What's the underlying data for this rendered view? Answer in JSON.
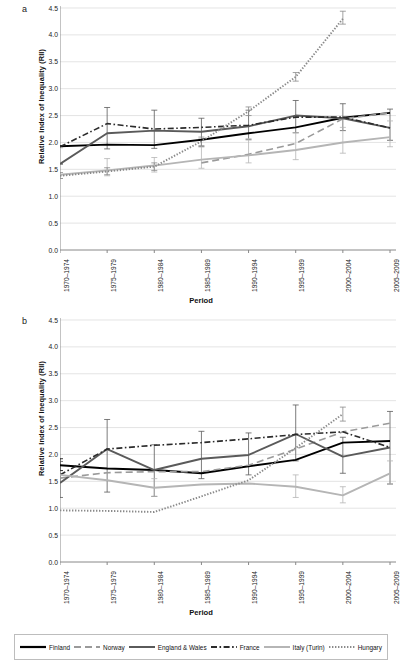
{
  "figure": {
    "panels": [
      {
        "letter": "a"
      },
      {
        "letter": "b"
      }
    ],
    "axis": {
      "xlabel": "Period",
      "ylabel": "Relative Index of Inequality (RII)",
      "yticks": [
        "4.5",
        "4.0",
        "3.5",
        "3.0",
        "2.5",
        "2.0",
        "1.5",
        "1.0",
        "0.5",
        "0.0"
      ],
      "ylim": [
        0.0,
        4.5
      ],
      "categories": [
        "1970–1974",
        "1975–1979",
        "1980–1984",
        "1985–1989",
        "1990–1994",
        "1995–1999",
        "2000–2004",
        "2005–2009"
      ]
    },
    "legend": [
      {
        "label": "Finland",
        "icon": "solid-black-line-swatch",
        "color": "#000000",
        "style": "solid",
        "width": 2.2
      },
      {
        "label": "Norway",
        "icon": "dashed-gray-line-swatch",
        "color": "#9a9a9a",
        "style": "longdash",
        "width": 1.8
      },
      {
        "label": "England & Wales",
        "icon": "solid-dark-gray-line-swatch",
        "color": "#5a5a5a",
        "style": "solid",
        "width": 2.0
      },
      {
        "label": "France",
        "icon": "dashdot-black-line-swatch",
        "color": "#2b2b2b",
        "style": "dashdot",
        "width": 1.8
      },
      {
        "label": "Italy (Turin)",
        "icon": "solid-light-gray-line-swatch",
        "color": "#b5b5b5",
        "style": "solid",
        "width": 2.0
      },
      {
        "label": "Hungary",
        "icon": "dotted-gray-line-swatch",
        "color": "#8a8a8a",
        "style": "dotted",
        "width": 1.8
      }
    ]
  },
  "chart_data": [
    {
      "type": "line",
      "panel": "a",
      "title": "",
      "xlabel": "Period",
      "ylabel": "Relative Index of Inequality (RII)",
      "ylim": [
        0.0,
        4.5
      ],
      "ytick_step": 0.5,
      "grid": "horizontal",
      "legend_position": "bottom-shared",
      "categories": [
        "1970–1974",
        "1975–1979",
        "1980–1984",
        "1985–1989",
        "1990–1994",
        "1995–1999",
        "2000–2004",
        "2005–2009"
      ],
      "series": [
        {
          "name": "Finland",
          "color": "#000000",
          "style": "solid",
          "values": [
            1.93,
            1.96,
            1.95,
            2.05,
            2.17,
            2.28,
            2.46,
            2.55
          ],
          "err_low": [
            null,
            null,
            null,
            null,
            null,
            null,
            null,
            null
          ],
          "err_high": [
            null,
            null,
            null,
            null,
            null,
            null,
            null,
            null
          ]
        },
        {
          "name": "Norway",
          "color": "#9a9a9a",
          "style": "longdash",
          "values": [
            null,
            null,
            null,
            1.62,
            1.78,
            1.98,
            2.44,
            2.55
          ],
          "err_low": [
            null,
            null,
            null,
            null,
            null,
            null,
            null,
            null
          ],
          "err_high": [
            null,
            null,
            null,
            null,
            null,
            null,
            null,
            null
          ]
        },
        {
          "name": "England & Wales",
          "color": "#5a5a5a",
          "style": "solid",
          "values": [
            1.6,
            2.17,
            2.22,
            2.2,
            2.3,
            2.5,
            2.45,
            2.27
          ],
          "err_low": [
            1.6,
            1.88,
            1.89,
            1.92,
            2.05,
            2.18,
            2.22,
            2.04
          ],
          "err_high": [
            1.6,
            2.65,
            2.6,
            2.45,
            2.6,
            2.78,
            2.72,
            2.62
          ]
        },
        {
          "name": "France",
          "color": "#2b2b2b",
          "style": "dashdot",
          "values": [
            1.92,
            2.35,
            2.25,
            2.28,
            2.32,
            2.47,
            2.47,
            2.27
          ],
          "err_low": [
            null,
            null,
            null,
            null,
            null,
            null,
            null,
            null
          ],
          "err_high": [
            null,
            null,
            null,
            null,
            null,
            null,
            null,
            null
          ]
        },
        {
          "name": "Italy (Turin)",
          "color": "#b5b5b5",
          "style": "solid",
          "values": [
            1.4,
            1.48,
            1.57,
            1.68,
            1.76,
            1.86,
            2.0,
            2.1
          ],
          "err_low": [
            1.33,
            1.38,
            1.45,
            1.52,
            1.62,
            1.68,
            1.8,
            1.92
          ],
          "err_high": [
            1.9,
            1.7,
            1.72,
            2.07,
            2.07,
            2.18,
            2.28,
            2.4
          ]
        },
        {
          "name": "Hungary",
          "color": "#8a8a8a",
          "style": "dotted",
          "values": [
            1.38,
            1.46,
            1.55,
            2.02,
            2.58,
            3.22,
            4.3,
            null
          ],
          "err_low": [
            1.33,
            1.4,
            1.48,
            1.94,
            2.5,
            3.14,
            4.2,
            null
          ],
          "err_high": [
            1.44,
            1.53,
            1.62,
            2.1,
            2.66,
            3.3,
            4.44,
            null
          ]
        }
      ]
    },
    {
      "type": "line",
      "panel": "b",
      "title": "",
      "xlabel": "Period",
      "ylabel": "Relative Index of Inequality (RII)",
      "ylim": [
        0.0,
        4.5
      ],
      "ytick_step": 0.5,
      "grid": "horizontal",
      "legend_position": "bottom-shared",
      "categories": [
        "1970–1974",
        "1975–1979",
        "1980–1984",
        "1985–1989",
        "1990–1994",
        "1995–1999",
        "2000–2004",
        "2005–2009"
      ],
      "series": [
        {
          "name": "Finland",
          "color": "#000000",
          "style": "solid",
          "values": [
            1.8,
            1.74,
            1.71,
            1.65,
            1.78,
            1.9,
            2.22,
            2.25
          ],
          "err_low": [
            1.7,
            null,
            null,
            null,
            null,
            null,
            null,
            null
          ],
          "err_high": [
            1.92,
            null,
            null,
            null,
            null,
            null,
            null,
            null
          ]
        },
        {
          "name": "Norway",
          "color": "#9a9a9a",
          "style": "longdash",
          "values": [
            1.56,
            1.66,
            1.68,
            1.68,
            1.8,
            2.1,
            2.42,
            2.58
          ],
          "err_low": [
            null,
            null,
            null,
            null,
            null,
            null,
            null,
            null
          ],
          "err_high": [
            null,
            null,
            null,
            null,
            null,
            null,
            null,
            null
          ]
        },
        {
          "name": "England & Wales",
          "color": "#5a5a5a",
          "style": "solid",
          "values": [
            1.47,
            2.1,
            1.71,
            1.92,
            1.99,
            2.38,
            1.96,
            2.13
          ],
          "err_low": [
            1.2,
            1.3,
            1.22,
            1.55,
            1.62,
            1.88,
            1.65,
            1.45
          ],
          "err_high": [
            1.87,
            2.65,
            2.18,
            2.43,
            2.4,
            2.92,
            2.32,
            2.8
          ]
        },
        {
          "name": "France",
          "color": "#2b2b2b",
          "style": "dashdot",
          "values": [
            1.62,
            2.1,
            2.17,
            2.22,
            2.29,
            2.37,
            2.42,
            2.13
          ],
          "err_low": [
            null,
            null,
            null,
            null,
            null,
            null,
            null,
            null
          ],
          "err_high": [
            null,
            null,
            null,
            null,
            null,
            null,
            null,
            null
          ]
        },
        {
          "name": "Italy (Turin)",
          "color": "#b5b5b5",
          "style": "solid",
          "values": [
            1.62,
            1.52,
            1.38,
            1.44,
            1.46,
            1.4,
            1.24,
            1.65
          ],
          "err_low": [
            null,
            null,
            1.22,
            null,
            null,
            1.2,
            1.1,
            1.45
          ],
          "err_high": [
            null,
            null,
            1.55,
            null,
            null,
            1.62,
            1.4,
            1.88
          ]
        },
        {
          "name": "Hungary",
          "color": "#8a8a8a",
          "style": "dotted",
          "values": [
            0.96,
            0.95,
            0.93,
            1.22,
            1.52,
            2.12,
            2.75,
            null
          ],
          "err_low": [
            null,
            null,
            null,
            null,
            null,
            null,
            2.62,
            null
          ],
          "err_high": [
            null,
            null,
            null,
            null,
            null,
            null,
            2.88,
            null
          ]
        }
      ]
    }
  ]
}
